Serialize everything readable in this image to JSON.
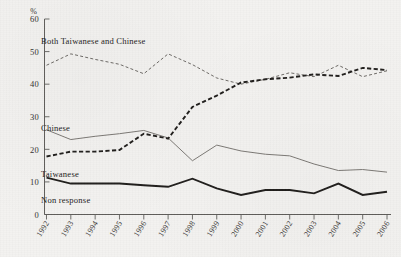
{
  "figure": {
    "background_color": "#f3f2f0",
    "ink_color": "#2b2927"
  },
  "chart_data": {
    "type": "line",
    "title": "",
    "xlabel": "",
    "ylabel": "",
    "yunit": "%",
    "xlim": [
      1992,
      2006
    ],
    "ylim": [
      0,
      60
    ],
    "yticks": [
      0,
      10,
      20,
      30,
      40,
      50,
      60
    ],
    "ytick_labels": [
      "0",
      "10",
      "20",
      "30",
      "40",
      "50",
      "60"
    ],
    "grid": false,
    "legend_position": "inline-annotations",
    "categories": [
      1992,
      1993,
      1994,
      1995,
      1996,
      1997,
      1998,
      1999,
      2000,
      2001,
      2002,
      2003,
      2004,
      2005,
      2006
    ],
    "xtick_labels": [
      "1992",
      "1993",
      "1994",
      "1995",
      "1996",
      "1997",
      "1998",
      "1999",
      "2000",
      "2001",
      "2002",
      "2003",
      "2004",
      "2005",
      "2006"
    ],
    "series": [
      {
        "name": "Both Taiwanese and Chinese",
        "style": "fine-dashed",
        "color": "#6d6a66",
        "values": [
          45.8,
          49.3,
          47.6,
          46.1,
          43.2,
          49.3,
          46.0,
          41.9,
          40.0,
          41.5,
          43.5,
          42.3,
          45.8,
          42.3,
          44.1
        ]
      },
      {
        "name": "Chinese",
        "style": "solid",
        "color": "#7c7975",
        "values": [
          26.0,
          23.0,
          24.0,
          24.8,
          25.8,
          23.5,
          16.5,
          21.3,
          19.5,
          18.5,
          18.0,
          15.5,
          13.5,
          13.8,
          13.0
        ]
      },
      {
        "name": "Taiwanese",
        "style": "bold-dashed",
        "color": "#1f1d1b",
        "values": [
          17.8,
          19.3,
          19.3,
          19.8,
          24.8,
          23.3,
          33.0,
          36.5,
          40.5,
          41.5,
          42.0,
          43.0,
          42.5,
          45.0,
          44.3
        ]
      },
      {
        "name": "Non response",
        "style": "bold-solid",
        "color": "#1f1d1b",
        "values": [
          11.3,
          9.5,
          9.5,
          9.5,
          9.0,
          8.5,
          11.0,
          8.0,
          6.0,
          7.5,
          7.5,
          6.5,
          9.5,
          6.0,
          7.0
        ]
      }
    ],
    "annotations": [
      {
        "text": "Both Taiwanese and Chinese",
        "x_px": 41,
        "y_px": 44
      },
      {
        "text": "Chinese",
        "x_px": 41,
        "y_px": 131
      },
      {
        "text": "Taiwanese",
        "x_px": 41,
        "y_px": 177
      },
      {
        "text": "Non response",
        "x_px": 41,
        "y_px": 203
      }
    ]
  }
}
